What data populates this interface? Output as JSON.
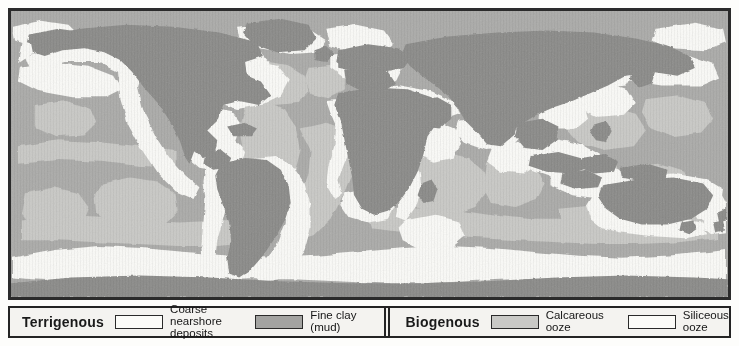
{
  "figure": {
    "map_border_color": "#2b2b2b",
    "background_color": "#fdfdfb"
  },
  "map": {
    "ocean_base_color": "#b9b9b7",
    "regions": {
      "continent_land": {
        "name": "Continental land mass",
        "color": "#8b8b89"
      },
      "coarse_nearshore_deposits": {
        "name": "Coarse nearshore deposits",
        "color": "#fbfbf8"
      },
      "fine_clay_mud": {
        "name": "Fine clay (mud)",
        "color": "#a3a3a1"
      },
      "calcareous_ooze": {
        "name": "Calcareous ooze",
        "color": "#c9c9c6"
      },
      "siliceous_ooze": {
        "name": "Siliceous ooze",
        "color": "#fbfbf8"
      }
    }
  },
  "legend": {
    "terrigenous": {
      "title": "Terrigenous",
      "entries": [
        {
          "label": "Coarse nearshore\ndeposits",
          "swatch_color": "#fbfbf8",
          "swatch_name": "coarse-nearshore-deposits-swatch"
        },
        {
          "label": "Fine clay (mud)",
          "swatch_color": "#a3a3a1",
          "swatch_name": "fine-clay-mud-swatch"
        }
      ]
    },
    "biogenous": {
      "title": "Biogenous",
      "entries": [
        {
          "label": "Calcareous ooze",
          "swatch_color": "#c9c9c6",
          "swatch_name": "calcareous-ooze-swatch"
        },
        {
          "label": "Siliceous ooze",
          "swatch_color": "#fbfbf8",
          "swatch_name": "siliceous-ooze-swatch"
        }
      ]
    }
  }
}
